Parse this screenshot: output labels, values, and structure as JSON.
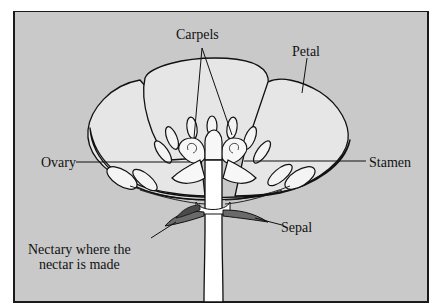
{
  "diagram": {
    "background_color": "#c9c9c9",
    "petal_fill": "#e6e6e6",
    "inner_fill": "#f4f4f4",
    "outline_color": "#111111",
    "nectary_fill": "#6a6a6a",
    "labels": {
      "carpels": "Carpels",
      "petal": "Petal",
      "ovary": "Ovary",
      "stamen": "Stamen",
      "sepal": "Sepal",
      "nectary_line1": "Nectary where the",
      "nectary_line2": "nectar is made"
    }
  }
}
